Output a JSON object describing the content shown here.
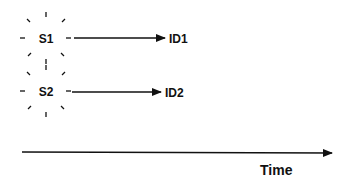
{
  "diagram": {
    "sources": [
      {
        "id": "s1",
        "label": "S1",
        "cx": 46,
        "cy": 38,
        "target_label": "ID1",
        "arrow_start_x": 74,
        "arrow_end_x": 165,
        "target_x": 169
      },
      {
        "id": "s2",
        "label": "S2",
        "cx": 46,
        "cy": 91,
        "target_label": "ID2",
        "arrow_start_x": 72,
        "arrow_end_x": 161,
        "target_x": 165
      }
    ],
    "time_axis": {
      "label": "Time",
      "y": 152,
      "x_start": 22,
      "x_end": 332
    },
    "colors": {
      "stroke": "#111111",
      "background": "#ffffff"
    }
  }
}
